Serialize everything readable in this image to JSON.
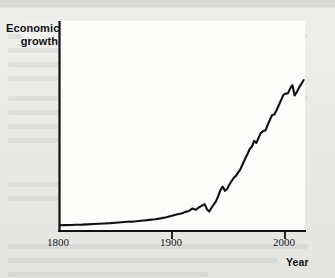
{
  "figure": {
    "name": "economic-growth-over-time",
    "background_color": "#e9e9e7",
    "plot_background_color": "#fdfdfc",
    "line_color": "#111111"
  },
  "chart_data": {
    "type": "line",
    "title": "",
    "xlabel": "Year",
    "ylabel": "Economic growth",
    "ylabel_lines": [
      "Economic",
      "growth"
    ],
    "xlim": [
      1800,
      2018
    ],
    "ylim": [
      0,
      100
    ],
    "grid": false,
    "legend": null,
    "xticks": [
      1800,
      1900,
      2000
    ],
    "xtick_labels": [
      "1800",
      "1900",
      "2000"
    ],
    "yticks": [],
    "ytick_labels": [],
    "axis_style": "left-and-bottom-spines-only",
    "series": [
      {
        "name": "Economic growth",
        "color": "#111111",
        "x": [
          1800,
          1805,
          1810,
          1815,
          1820,
          1825,
          1830,
          1835,
          1840,
          1845,
          1850,
          1855,
          1860,
          1865,
          1870,
          1875,
          1880,
          1885,
          1890,
          1895,
          1900,
          1903,
          1906,
          1909,
          1912,
          1915,
          1918,
          1921,
          1924,
          1927,
          1929,
          1931,
          1933,
          1935,
          1937,
          1939,
          1941,
          1943,
          1945,
          1947,
          1949,
          1951,
          1953,
          1955,
          1957,
          1959,
          1961,
          1963,
          1965,
          1967,
          1969,
          1971,
          1973,
          1975,
          1977,
          1979,
          1981,
          1983,
          1985,
          1987,
          1989,
          1991,
          1993,
          1995,
          1997,
          1999,
          2001,
          2003,
          2005,
          2007,
          2009,
          2011,
          2013,
          2015,
          2017
        ],
        "y": [
          2.2,
          2.3,
          2.4,
          2.5,
          2.6,
          2.8,
          3.0,
          3.2,
          3.4,
          3.6,
          3.9,
          4.2,
          4.5,
          4.6,
          5.0,
          5.4,
          5.8,
          6.2,
          6.8,
          7.6,
          8.6,
          9.2,
          9.8,
          10.3,
          11.2,
          11.8,
          13.4,
          12.6,
          14.2,
          15.6,
          16.4,
          13.0,
          11.4,
          13.8,
          16.0,
          18.2,
          21.6,
          25.8,
          28.2,
          25.4,
          26.6,
          29.6,
          32.0,
          34.2,
          35.6,
          38.0,
          40.2,
          43.6,
          47.0,
          50.0,
          53.4,
          55.2,
          59.0,
          57.6,
          61.2,
          64.4,
          65.6,
          66.0,
          69.6,
          73.2,
          76.4,
          76.8,
          79.8,
          83.2,
          86.6,
          90.0,
          90.8,
          91.0,
          94.2,
          96.6,
          89.6,
          92.0,
          95.0,
          97.4,
          100.0
        ]
      }
    ],
    "annotations": [
      {
        "label": "flat pre-industrial baseline",
        "x_range": [
          1800,
          1880
        ]
      },
      {
        "label": "post-WWI contraction",
        "x_range": [
          1918,
          1921
        ]
      },
      {
        "label": "Great Depression trough",
        "x_range": [
          1929,
          1933
        ]
      },
      {
        "label": "postwar adjustment dip",
        "x_range": [
          1945,
          1947
        ]
      },
      {
        "label": "mid-1970s recession",
        "x_range": [
          1973,
          1975
        ]
      },
      {
        "label": "2008-09 financial crisis dip",
        "x_range": [
          2007,
          2009
        ]
      }
    ]
  }
}
